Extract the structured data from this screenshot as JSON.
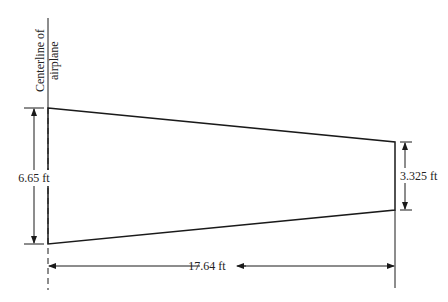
{
  "diagram": {
    "centerline_label_line1": "Centerline of",
    "centerline_label_line2": "airplane",
    "root_chord_label": "6.65 ft",
    "tip_chord_label": "3.325 ft",
    "semispan_label": "17.64 ft",
    "colors": {
      "line": "#1a1a1a",
      "text": "#222222",
      "background": "#ffffff"
    },
    "dimensions": {
      "root_chord_ft": 6.65,
      "tip_chord_ft": 3.325,
      "semispan_ft": 17.64
    }
  }
}
